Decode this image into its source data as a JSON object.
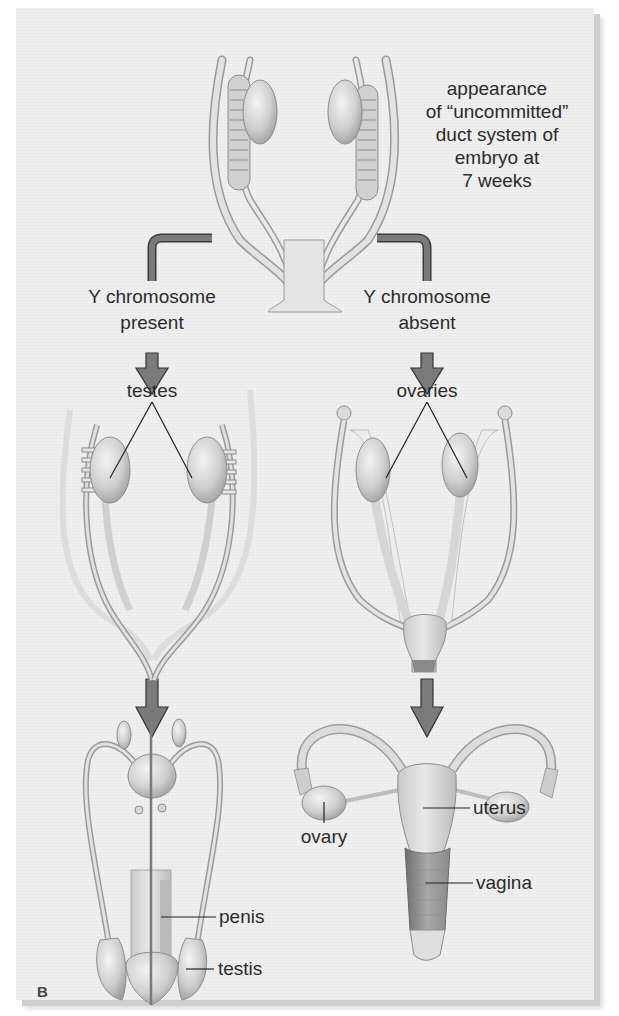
{
  "figure": {
    "panel_letter": "B",
    "caption_top": {
      "line1": "appearance",
      "line2": "of “uncommitted”",
      "line3": "duct system of",
      "line4": "embryo at",
      "line5": "7 weeks"
    },
    "branches": {
      "left": {
        "condition_line1": "Y chromosome",
        "condition_line2": "present",
        "intermediate_label": "testes",
        "final_labels": {
          "penis": "penis",
          "testis": "testis"
        }
      },
      "right": {
        "condition_line1": "Y chromosome",
        "condition_line2": "absent",
        "intermediate_label": "ovaries",
        "final_labels": {
          "ovary": "ovary",
          "uterus": "uterus",
          "vagina": "vagina"
        }
      }
    },
    "colors": {
      "panel_bg": "#efefef",
      "arrow_fill": "#7a7a7a",
      "arrow_stroke": "#3a3a3a",
      "tissue_light": "#dedede",
      "tissue_mid": "#c4c4c4",
      "leader_line": "#222222"
    }
  }
}
